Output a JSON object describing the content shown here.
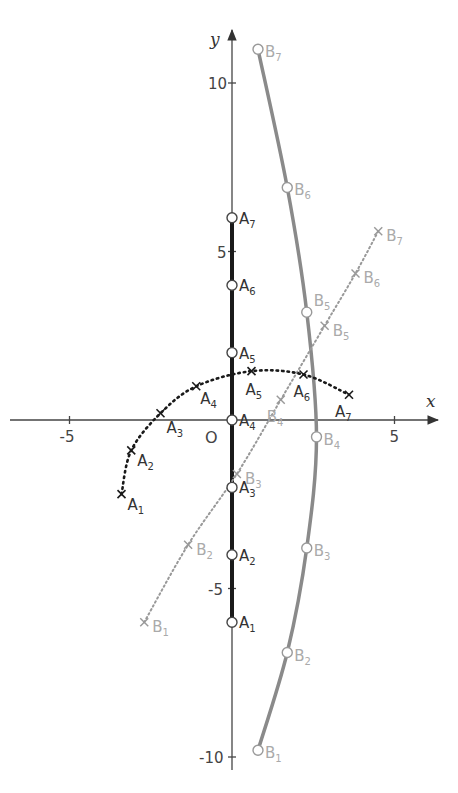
{
  "diagram": {
    "colors": {
      "axis": "#444444",
      "a_segment": "#1a1a1a",
      "a_curve": "#1a1a1a",
      "b_curve": "#888888",
      "b_line": "#999999",
      "b_label": "#aaaaaa",
      "a_label": "#333333"
    },
    "axes": {
      "x_label": "x",
      "y_label": "y",
      "origin_label": "O",
      "x_ticks": [
        {
          "value": -5,
          "label": "-5"
        },
        {
          "value": 5,
          "label": "5"
        }
      ],
      "y_ticks": [
        {
          "value": 10,
          "label": "10"
        },
        {
          "value": 5,
          "label": "5"
        },
        {
          "value": -5,
          "label": "-5"
        },
        {
          "value": -10,
          "label": "-10"
        }
      ]
    },
    "a_points_on_axis": [
      {
        "name": "A",
        "sub": "1",
        "x": 0,
        "y": -6
      },
      {
        "name": "A",
        "sub": "2",
        "x": 0,
        "y": -4
      },
      {
        "name": "A",
        "sub": "3",
        "x": 0,
        "y": -2
      },
      {
        "name": "A",
        "sub": "4",
        "x": 0,
        "y": 0
      },
      {
        "name": "A",
        "sub": "5",
        "x": 0,
        "y": 2
      },
      {
        "name": "A",
        "sub": "6",
        "x": 0,
        "y": 4
      },
      {
        "name": "A",
        "sub": "7",
        "x": 0,
        "y": 6
      }
    ],
    "a_points_on_arc": [
      {
        "name": "A",
        "sub": "1",
        "x": -3.4,
        "y": -2.2
      },
      {
        "name": "A",
        "sub": "2",
        "x": -3.1,
        "y": -0.9
      },
      {
        "name": "A",
        "sub": "3",
        "x": -2.2,
        "y": 0.2
      },
      {
        "name": "A",
        "sub": "4",
        "x": -1.1,
        "y": 1.0
      },
      {
        "name": "A",
        "sub": "5",
        "x": 0.6,
        "y": 1.45
      },
      {
        "name": "A",
        "sub": "6",
        "x": 2.2,
        "y": 1.35
      },
      {
        "name": "A",
        "sub": "7",
        "x": 3.6,
        "y": 0.75
      }
    ],
    "b_points_on_curve": [
      {
        "name": "B",
        "sub": "1",
        "x": 0.8,
        "y": -9.8
      },
      {
        "name": "B",
        "sub": "2",
        "x": 1.7,
        "y": -6.9
      },
      {
        "name": "B",
        "sub": "3",
        "x": 2.3,
        "y": -3.8
      },
      {
        "name": "B",
        "sub": "4",
        "x": 2.6,
        "y": -0.5
      },
      {
        "name": "B",
        "sub": "5",
        "x": 2.3,
        "y": 3.2
      },
      {
        "name": "B",
        "sub": "6",
        "x": 1.7,
        "y": 6.9
      },
      {
        "name": "B",
        "sub": "7",
        "x": 0.8,
        "y": 11.0
      }
    ],
    "b_points_on_line": [
      {
        "name": "B",
        "sub": "1",
        "x": -2.7,
        "y": -6.0
      },
      {
        "name": "B",
        "sub": "2",
        "x": -1.35,
        "y": -3.7
      },
      {
        "name": "B",
        "sub": "3",
        "x": 0.15,
        "y": -1.6
      },
      {
        "name": "B",
        "sub": "4",
        "x": 1.5,
        "y": 0.6
      },
      {
        "name": "B",
        "sub": "5",
        "x": 2.85,
        "y": 2.8
      },
      {
        "name": "B",
        "sub": "6",
        "x": 3.8,
        "y": 4.35
      },
      {
        "name": "B",
        "sub": "7",
        "x": 4.5,
        "y": 5.6
      }
    ]
  }
}
